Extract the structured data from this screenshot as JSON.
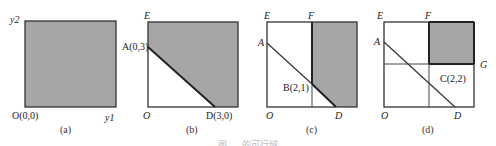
{
  "colors": {
    "shade": "#a6a6a6",
    "stroke": "#333333",
    "background": "#ffffff"
  },
  "panels": [
    {
      "id": "a",
      "caption": "(a)",
      "labels": {
        "y_axis": "y2",
        "origin": "O(0,0)",
        "x_axis": "y1"
      },
      "description": "Entire square shaded"
    },
    {
      "id": "b",
      "caption": "(b)",
      "labels": {
        "top_left": "E",
        "point_a": "A(0,3)",
        "origin": "O",
        "point_d": "D(3,0)"
      },
      "description": "Region above line AD shaded"
    },
    {
      "id": "c",
      "caption": "(c)",
      "labels": {
        "top_left": "E",
        "top_mid": "F",
        "point_a": "A",
        "point_b": "B(2,1)",
        "origin": "O",
        "point_d": "D"
      },
      "description": "Region right of vertical line through F and above line AD shaded"
    },
    {
      "id": "d",
      "caption": "(d)",
      "labels": {
        "top_left": "E",
        "top_mid": "F",
        "point_a": "A",
        "right_mid": "G",
        "point_c": "C(2,2)",
        "origin": "O",
        "point_d": "D"
      },
      "description": "Top-right rectangle bounded by F line and G line shaded"
    }
  ],
  "figure_caption": "图 … 的可行域"
}
